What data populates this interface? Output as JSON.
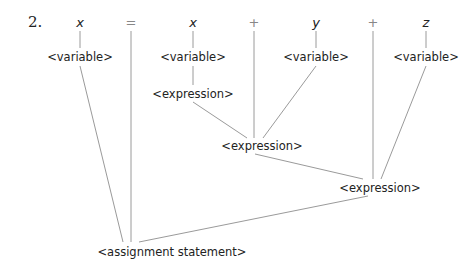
{
  "item_number": "2.",
  "tokens": {
    "t1": "x",
    "t2": "=",
    "t3": "x",
    "t4": "+",
    "t5": "y",
    "t6": "+",
    "t7": "z"
  },
  "nodes": {
    "var1": "<variable>",
    "var2": "<variable>",
    "var3": "<variable>",
    "var4": "<variable>",
    "expr1": "<expression>",
    "expr2": "<expression>",
    "expr3": "<expression>",
    "root": "<assignment statement>"
  },
  "colors": {
    "line": "#9a9a9a",
    "text": "#222222"
  }
}
